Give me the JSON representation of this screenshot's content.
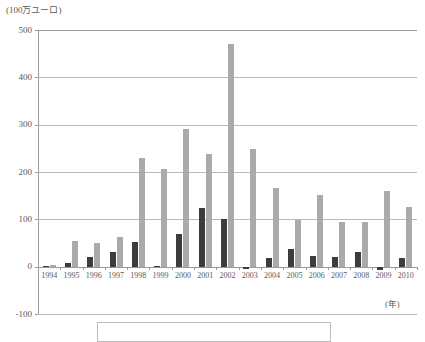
{
  "chart_data": {
    "type": "bar",
    "title": "",
    "subtitle": "",
    "ylabel": "(100万ユーロ)",
    "xlabel": "(年)",
    "categories": [
      "1994",
      "1995",
      "1996",
      "1997",
      "1998",
      "1999",
      "2000",
      "2001",
      "2002",
      "2003",
      "2004",
      "2005",
      "2006",
      "2007",
      "2008",
      "2009",
      "2010"
    ],
    "series": [
      {
        "name": "dark-series",
        "color": "#3c3c3c",
        "values": [
          2,
          7,
          20,
          32,
          52,
          2,
          70,
          124,
          100,
          -5,
          19,
          37,
          22,
          20,
          30,
          -7,
          18
        ]
      },
      {
        "name": "light-series",
        "color": "#aaaaaa",
        "values": [
          3,
          55,
          50,
          62,
          229,
          206,
          291,
          237,
          470,
          248,
          166,
          98,
          152,
          95,
          95,
          160,
          126
        ]
      }
    ],
    "ylim": [
      -100,
      500
    ],
    "ytick_labels": [
      "500",
      "400",
      "300",
      "200",
      "100",
      "0",
      "-100"
    ],
    "ytick_values": [
      500,
      400,
      300,
      200,
      100,
      0,
      -100
    ],
    "grid": "horizontal",
    "legend_position": "bottom"
  },
  "axes": {
    "y_unit": "(100万ユーロ)",
    "x_unit": "(年)"
  },
  "legend": {
    "visible": true,
    "entries": []
  }
}
